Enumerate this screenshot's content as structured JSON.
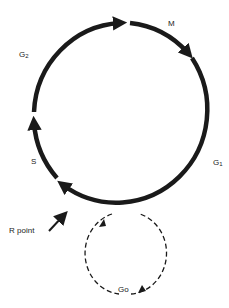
{
  "diagram": {
    "phases": [
      {
        "id": "M",
        "label": "M"
      },
      {
        "id": "G1",
        "label": "G",
        "sub": "1"
      },
      {
        "id": "S",
        "label": "S"
      },
      {
        "id": "G2",
        "label": "G",
        "sub": "2"
      }
    ],
    "restriction": {
      "label": "R point"
    },
    "quiescent": {
      "label": "G",
      "sub": "o"
    },
    "colors": {
      "stroke": "#1a1a1a",
      "background": "#ffffff"
    }
  }
}
